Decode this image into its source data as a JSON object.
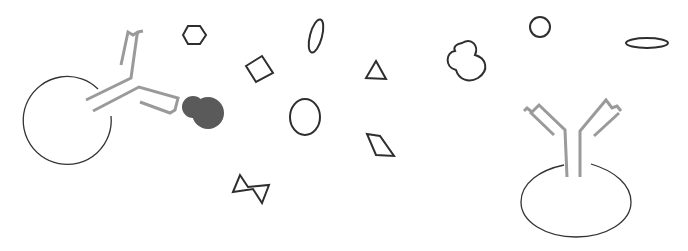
{
  "diagram": {
    "colors": {
      "outline": "#2e2e2e",
      "antibody": "#9a9a9a",
      "bound_antigen": "#5a5a5a",
      "background": "#ffffff"
    },
    "elements": [
      {
        "name": "cell-left",
        "kind": "cell"
      },
      {
        "name": "antibody-left",
        "kind": "antibody",
        "state": "bound"
      },
      {
        "name": "bound-antigen",
        "kind": "antigen",
        "state": "bound"
      },
      {
        "name": "cell-right",
        "kind": "cell"
      },
      {
        "name": "antibody-right",
        "kind": "antibody",
        "state": "unbound"
      },
      {
        "name": "antigen-hexagon",
        "kind": "antigen"
      },
      {
        "name": "antigen-square",
        "kind": "antigen"
      },
      {
        "name": "antigen-tall-ellipse",
        "kind": "antigen"
      },
      {
        "name": "antigen-triangle",
        "kind": "antigen"
      },
      {
        "name": "antigen-oval",
        "kind": "antigen"
      },
      {
        "name": "antigen-diamond",
        "kind": "antigen"
      },
      {
        "name": "antigen-bowtie",
        "kind": "antigen"
      },
      {
        "name": "antigen-blob",
        "kind": "antigen"
      },
      {
        "name": "antigen-small-circle",
        "kind": "antigen"
      },
      {
        "name": "antigen-flat-ellipse",
        "kind": "antigen"
      }
    ]
  }
}
